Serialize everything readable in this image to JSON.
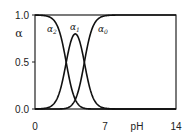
{
  "chart_data": {
    "type": "line",
    "title": "",
    "xlabel": "pH",
    "ylabel": "α",
    "xlim": [
      0,
      14
    ],
    "ylim": [
      0.0,
      1.0
    ],
    "x_ticks": [
      "0",
      "7",
      "14"
    ],
    "y_ticks": [
      "0.0",
      "0.5",
      "1.0"
    ],
    "grid": false,
    "legend": "inline curve labels",
    "pKa": [
      3.1,
      4.9
    ],
    "x": [
      0,
      1,
      2,
      2.5,
      3,
      3.5,
      4,
      4.5,
      5,
      5.5,
      6,
      7,
      8,
      10,
      12,
      14
    ],
    "series": [
      {
        "name": "α2",
        "label": "α2",
        "values": [
          1.0,
          0.99,
          0.93,
          0.8,
          0.55,
          0.28,
          0.1,
          0.03,
          0.01,
          0.0,
          0.0,
          0.0,
          0.0,
          0.0,
          0.0,
          0.0
        ]
      },
      {
        "name": "α1",
        "label": "α1",
        "values": [
          0.0,
          0.01,
          0.07,
          0.2,
          0.44,
          0.68,
          0.78,
          0.68,
          0.44,
          0.2,
          0.07,
          0.01,
          0.0,
          0.0,
          0.0,
          0.0
        ]
      },
      {
        "name": "α0",
        "label": "α0",
        "values": [
          0.0,
          0.0,
          0.0,
          0.0,
          0.01,
          0.04,
          0.12,
          0.29,
          0.55,
          0.8,
          0.93,
          0.99,
          1.0,
          1.0,
          1.0,
          1.0
        ]
      }
    ]
  },
  "axis": {
    "y_label": "α",
    "x_label": "pH",
    "y_ticks": [
      {
        "label": "1.0",
        "value": 1.0
      },
      {
        "label": "0.5",
        "value": 0.5
      },
      {
        "label": "0.0",
        "value": 0.0
      }
    ],
    "x_ticks": [
      {
        "label": "0",
        "value": 0
      },
      {
        "label": "7",
        "value": 7
      },
      {
        "label": "14",
        "value": 14
      }
    ]
  },
  "curve_labels": {
    "alpha2": "α2",
    "alpha1": "α1",
    "alpha0": "α0"
  }
}
